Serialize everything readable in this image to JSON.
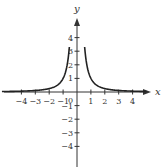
{
  "chart_data": {
    "type": "line",
    "title": "",
    "function": "y = 1/x^2",
    "xlabel": "x",
    "ylabel": "y",
    "xlim": [
      -5,
      5
    ],
    "ylim": [
      -5,
      6
    ],
    "grid": false,
    "origin_label": "0",
    "x_ticks": [
      -4,
      -3,
      -2,
      -1,
      1,
      2,
      3,
      4
    ],
    "x_tick_labels": [
      "−4",
      "−3",
      "−2",
      "−1",
      "1",
      "2",
      "3",
      "4"
    ],
    "y_ticks": [
      -4,
      -3,
      -2,
      -1,
      1,
      2,
      3,
      4
    ],
    "y_tick_labels": [
      "−4",
      "−3",
      "−2",
      "−1",
      "1",
      "2",
      "3",
      "4"
    ],
    "series": [
      {
        "name": "y = 1/x^2 (left branch)",
        "x": [
          -5,
          -4,
          -3,
          -2,
          -1.5,
          -1,
          -0.8,
          -0.7,
          -0.6
        ],
        "y": [
          0.04,
          0.0625,
          0.111,
          0.25,
          0.444,
          1,
          1.5625,
          2.04,
          2.78
        ]
      },
      {
        "name": "y = 1/x^2 (right branch)",
        "x": [
          0.6,
          0.7,
          0.8,
          1,
          1.5,
          2,
          3,
          4,
          5
        ],
        "y": [
          2.78,
          2.04,
          1.5625,
          1,
          0.444,
          0.25,
          0.111,
          0.0625,
          0.04
        ]
      }
    ],
    "colors": {
      "curve": "#222222",
      "axes": "#333333"
    }
  }
}
